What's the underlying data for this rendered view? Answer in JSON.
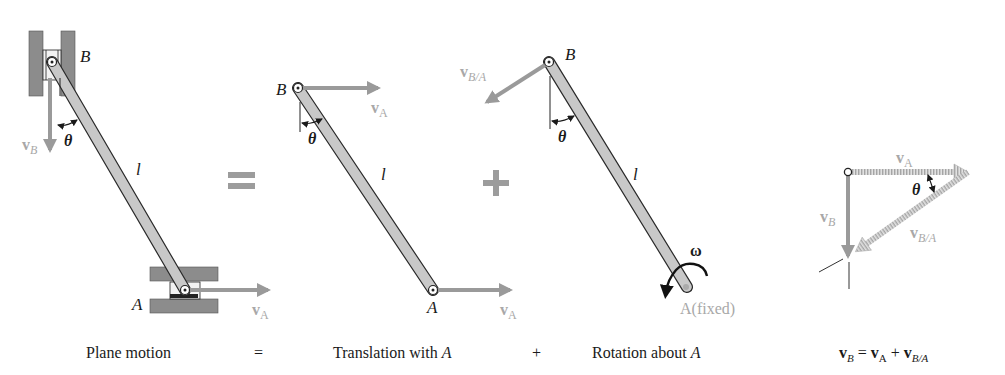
{
  "colors": {
    "background": "#ffffff",
    "bar_fill": "#c8c8c8",
    "bar_stroke": "#2a2a2a",
    "arrow_gray": "#9a9a9a",
    "label_gray": "#a8a8a8",
    "support_gray": "#8a8a8a",
    "text_dark": "#1a1a1a",
    "operator_gray": "#9c9c9c"
  },
  "panels": {
    "plane_motion": {
      "label_B": "B",
      "label_A": "A",
      "label_l": "l",
      "label_theta": "θ",
      "label_vB": "v",
      "label_vB_sub": "B",
      "label_vA": "v",
      "label_vA_sub": "A"
    },
    "translation": {
      "label_B": "B",
      "label_A": "A",
      "label_l": "l",
      "label_theta": "θ",
      "label_vA_top": "v",
      "label_vA_top_sub": "A",
      "label_vA_bottom": "v",
      "label_vA_bottom_sub": "A"
    },
    "rotation": {
      "label_B": "B",
      "label_l": "l",
      "label_theta": "θ",
      "label_omega": "ω",
      "label_vBA": "v",
      "label_vBA_sub": "B/A",
      "label_fixed": "A(fixed)"
    },
    "vector_triangle": {
      "label_vA": "v",
      "label_vA_sub": "A",
      "label_vB": "v",
      "label_vB_sub": "B",
      "label_vBA": "v",
      "label_vBA_sub": "B/A",
      "label_theta": "θ"
    }
  },
  "operators": {
    "equals_symbol": "=",
    "plus_symbol": "+"
  },
  "captions": {
    "plane_motion": "Plane motion",
    "equals": "=",
    "translation_prefix": "Translation with ",
    "translation_var": "A",
    "plus": "+",
    "rotation_prefix": "Rotation about ",
    "rotation_var": "A",
    "equation": {
      "vB": "v",
      "vB_sub": "B",
      "eq": " = ",
      "vA": "v",
      "vA_sub": "A",
      "plus": " + ",
      "vBA": "v",
      "vBA_sub": "B/A"
    }
  }
}
